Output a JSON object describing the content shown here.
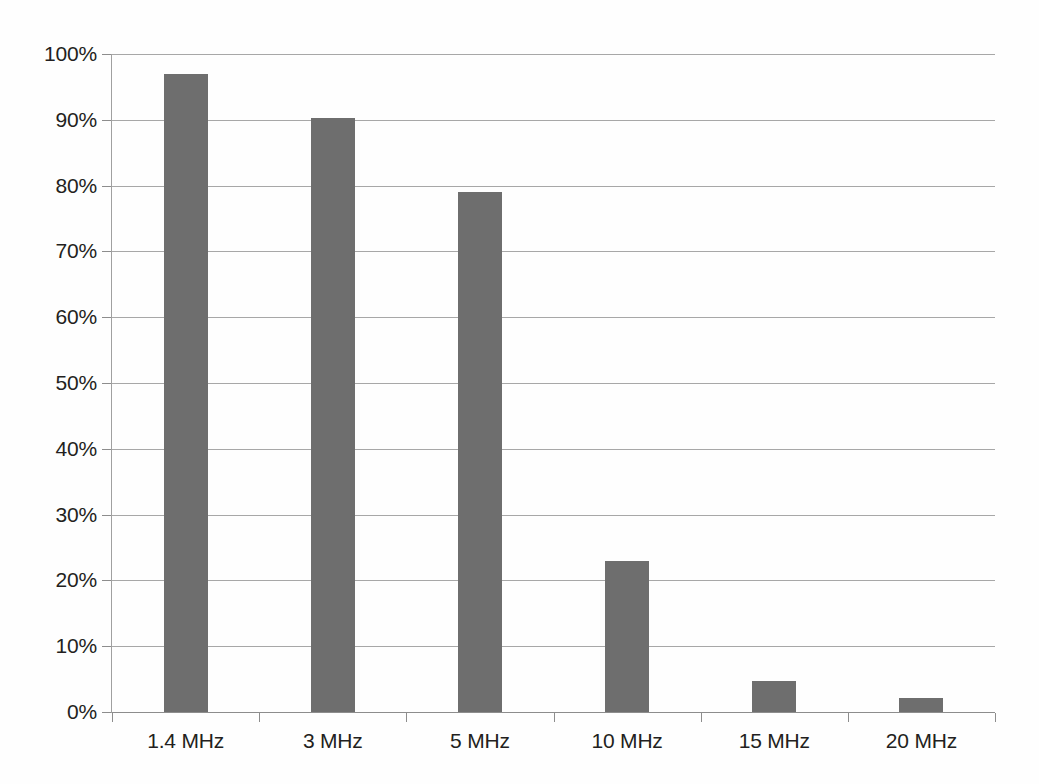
{
  "chart_data": {
    "type": "bar",
    "title": "",
    "subtitle": "",
    "xlabel": "",
    "ylabel": "",
    "categories": [
      "1.4 MHz",
      "3 MHz",
      "5 MHz",
      "10 MHz",
      "15 MHz",
      "20 MHz"
    ],
    "values": [
      97.0,
      90.3,
      79.1,
      22.9,
      4.7,
      2.2
    ],
    "value_unit": "%",
    "ylim": [
      0,
      100
    ],
    "y_ticks": [
      0,
      10,
      20,
      30,
      40,
      50,
      60,
      70,
      80,
      90,
      100
    ],
    "y_tick_labels": [
      "0%",
      "10%",
      "20%",
      "30%",
      "40%",
      "50%",
      "60%",
      "70%",
      "80%",
      "90%",
      "100%"
    ],
    "grid": true,
    "grid_axis": "y",
    "legend": false,
    "legend_position": "none",
    "series": [
      {
        "name": "",
        "color": "#6e6e6e",
        "values": [
          97.0,
          90.3,
          79.1,
          22.9,
          4.7,
          2.2
        ]
      }
    ],
    "colors": {
      "bar": "#6e6e6e",
      "gridline": "#a7a7a7",
      "axis": "#8d8d8d",
      "text": "#231f20",
      "background": "#fefefe"
    }
  }
}
